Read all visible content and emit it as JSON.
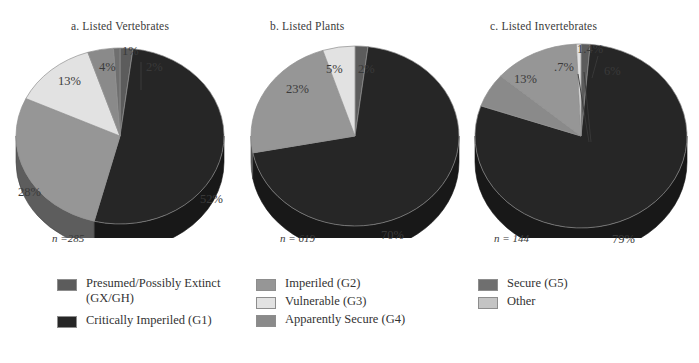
{
  "figure": {
    "background": "#ffffff",
    "text_color": "#3a3a3a"
  },
  "chart_data": [
    {
      "type": "pie",
      "title": "a. Listed Vertebrates",
      "n_label": "n =285",
      "n_value": 285,
      "categories": [
        "Presumed/Possibly Extinct (GX/GH)",
        "Critically Imperiled (G1)",
        "Imperiled (G2)",
        "Vulnerable (G3)",
        "Apparently Secure (G4)",
        "Secure (G5)",
        "Other"
      ],
      "values": [
        2,
        52,
        28,
        13,
        4,
        1,
        0
      ],
      "labels": [
        "2%",
        "52%",
        "28%",
        "13%",
        "4%",
        "1%",
        ""
      ],
      "colors": [
        "#5c5c5c",
        "#262626",
        "#969696",
        "#e2e2e2",
        "#8a8a8a",
        "#6f6f6f",
        "#c4c4c4"
      ],
      "xlabel": "",
      "ylabel": "",
      "legend": "bottom"
    },
    {
      "type": "pie",
      "title": "b. Listed Plants",
      "n_label": "n = 619",
      "n_value": 619,
      "categories": [
        "Presumed/Possibly Extinct (GX/GH)",
        "Critically Imperiled (G1)",
        "Imperiled (G2)",
        "Vulnerable (G3)",
        "Apparently Secure (G4)",
        "Secure (G5)",
        "Other"
      ],
      "values": [
        2,
        70,
        23,
        5,
        0,
        0,
        0
      ],
      "labels": [
        "2%",
        "70%",
        "23%",
        "5%",
        "",
        "",
        ""
      ],
      "colors": [
        "#5c5c5c",
        "#262626",
        "#969696",
        "#e2e2e2",
        "#8a8a8a",
        "#6f6f6f",
        "#c4c4c4"
      ],
      "xlabel": "",
      "ylabel": "",
      "legend": "bottom"
    },
    {
      "type": "pie",
      "title": "c.  Listed Invertebrates",
      "n_label": "n = 144",
      "n_value": 144,
      "categories": [
        "Presumed/Possibly Extinct (GX/GH)",
        "Critically Imperiled (G1)",
        "Imperiled (G2)",
        "Vulnerable (G3)",
        "Apparently Secure (G4)",
        "Secure (G5)",
        "Other"
      ],
      "values": [
        1.4,
        79,
        13,
        0.7,
        6,
        0,
        0
      ],
      "labels": [
        "1.4%",
        "79%",
        "13%",
        ".7%",
        "6%",
        "",
        ""
      ],
      "colors": [
        "#5c5c5c",
        "#262626",
        "#969696",
        "#e2e2e2",
        "#8a8a8a",
        "#6f6f6f",
        "#c4c4c4"
      ],
      "xlabel": "",
      "ylabel": "",
      "legend": "bottom"
    }
  ],
  "panels": {
    "a": {
      "title": "a. Listed Vertebrates",
      "n_label": "n =285",
      "callouts": {
        "c1": "1%",
        "c2": "2%",
        "c4": "4%",
        "c13": "13%",
        "c28": "28%",
        "c52": "52%"
      }
    },
    "b": {
      "title": "b. Listed Plants",
      "n_label": "n = 619",
      "callouts": {
        "c5": "5%",
        "c2": "2%",
        "c23": "23%",
        "c70": "70%"
      }
    },
    "c": {
      "title": "c.  Listed Invertebrates",
      "n_label": "n = 144",
      "callouts": {
        "c14": "1.4%",
        "c07": ".7%",
        "c6": "6%",
        "c13": "13%",
        "c79": "79%"
      }
    }
  },
  "legend": {
    "columns": [
      {
        "items": [
          {
            "label": "Presumed/Possibly Extinct\n(GX/GH)",
            "color": "#5c5c5c",
            "swatch_name": "legend-swatch-gx-gh"
          },
          {
            "label": "Critically Imperiled (G1)",
            "color": "#262626",
            "swatch_name": "legend-swatch-g1"
          }
        ]
      },
      {
        "items": [
          {
            "label": "Imperiled (G2)",
            "color": "#969696",
            "swatch_name": "legend-swatch-g2"
          },
          {
            "label": "Vulnerable (G3)",
            "color": "#e2e2e2",
            "swatch_name": "legend-swatch-g3"
          },
          {
            "label": "Apparently Secure (G4)",
            "color": "#8a8a8a",
            "swatch_name": "legend-swatch-g4"
          }
        ]
      },
      {
        "items": [
          {
            "label": "Secure (G5)",
            "color": "#6f6f6f",
            "swatch_name": "legend-swatch-g5"
          },
          {
            "label": "Other",
            "color": "#c4c4c4",
            "swatch_name": "legend-swatch-other"
          }
        ]
      }
    ]
  }
}
